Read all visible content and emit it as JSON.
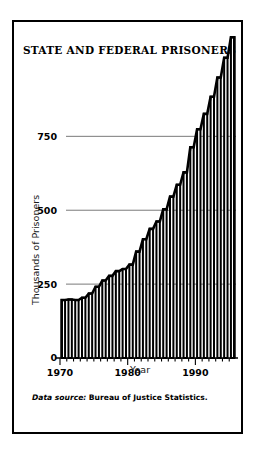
{
  "figure": {
    "title": "STATE AND FEDERAL PRISONERS",
    "source_prefix": "Data source:",
    "source_text": "Bureau of Justice Statistics.",
    "frame_color": "#000000",
    "background_color": "#ffffff"
  },
  "chart_data": {
    "type": "bar",
    "title": "STATE AND FEDERAL PRISONERS",
    "xlabel": "Year",
    "ylabel": "Thousands of Prisoners",
    "xlim": [
      1969.5,
      1995.5
    ],
    "ylim": [
      0,
      900
    ],
    "grid": true,
    "legend": null,
    "y_ticks": [
      0,
      250,
      500,
      750
    ],
    "y_tick_labels": [
      "0",
      "250",
      "500",
      "750"
    ],
    "x_ticks": [
      1970,
      1980,
      1990
    ],
    "x_tick_labels": [
      "1970",
      "1980",
      "1990"
    ],
    "x_minor_ticks": [
      1971,
      1972,
      1973,
      1974,
      1975,
      1976,
      1977,
      1978,
      1979,
      1981,
      1982,
      1983,
      1984,
      1985,
      1986,
      1987,
      1988,
      1989,
      1991,
      1992,
      1993,
      1994,
      1995
    ],
    "units": "thousands of prisoners",
    "categories": [
      1970,
      1971,
      1972,
      1973,
      1974,
      1975,
      1976,
      1977,
      1978,
      1979,
      1980,
      1981,
      1982,
      1983,
      1984,
      1985,
      1986,
      1987,
      1988,
      1989,
      1990,
      1991,
      1992,
      1993,
      1994,
      1995
    ],
    "values": [
      196,
      198,
      196,
      204,
      218,
      241,
      262,
      278,
      294,
      301,
      316,
      360,
      402,
      437,
      462,
      503,
      546,
      586,
      628,
      713,
      774,
      826,
      884,
      949,
      1016,
      1085
    ],
    "bar_color": "#ffffff",
    "bar_edge_color": "#000000"
  },
  "axes": {
    "y_title": "Thousands of Prisoners",
    "x_title": "Year"
  }
}
